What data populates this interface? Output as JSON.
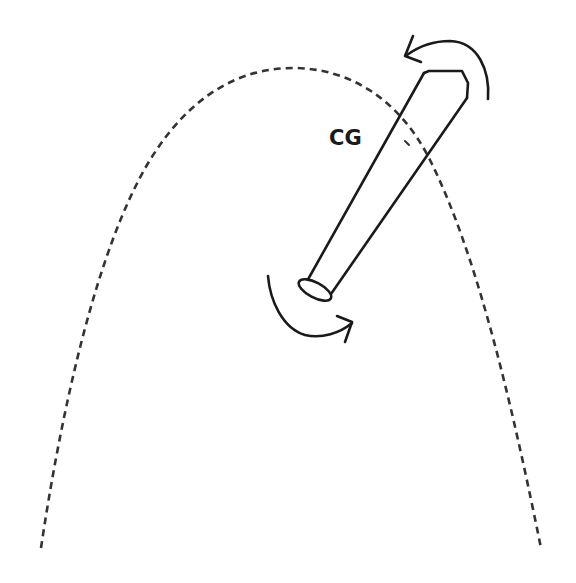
{
  "diagram": {
    "labels": {
      "cg": "CG"
    },
    "elements": {
      "trajectory": {
        "style": "dashed",
        "shape": "parabola",
        "apex": [
          293,
          68
        ],
        "left_end": [
          41,
          548
        ],
        "right_end": [
          541,
          548
        ]
      },
      "bat": {
        "barrel_end": "top-right",
        "knob_end": "bottom-left"
      },
      "rotation_arrows": [
        {
          "position": "top-right",
          "direction": "counter-clockwise"
        },
        {
          "position": "bottom-left",
          "direction": "counter-clockwise"
        }
      ]
    },
    "colors": {
      "stroke": "#1a1a1a",
      "dash": "#333333",
      "background": "#ffffff"
    }
  }
}
